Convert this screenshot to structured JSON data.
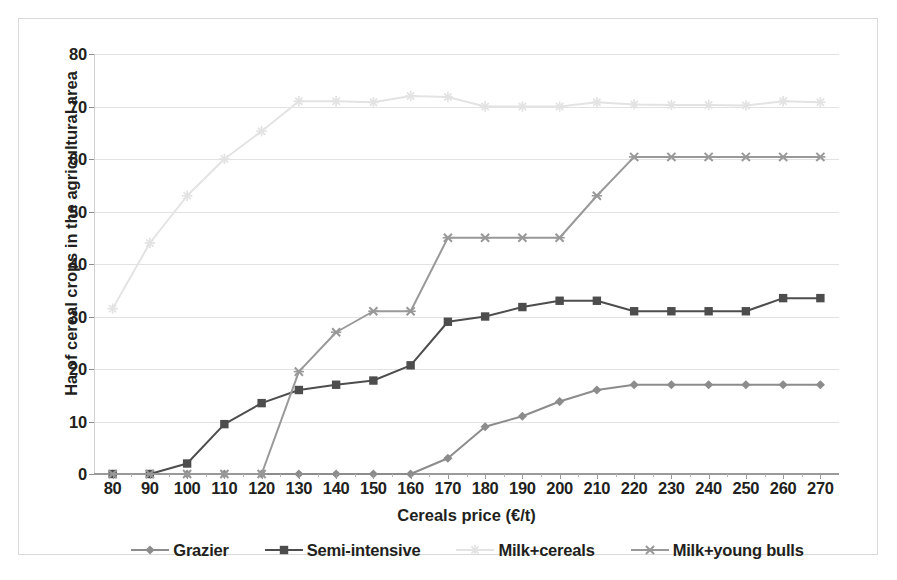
{
  "chart_data": {
    "type": "line",
    "title": "",
    "xlabel": "Cereals price (€/t)",
    "ylabel": "Ha of cereal crops in the agricultural area",
    "xlim": [
      75,
      275
    ],
    "ylim": [
      0,
      80
    ],
    "grid": true,
    "legend_position": "bottom",
    "x": [
      80,
      90,
      100,
      110,
      120,
      130,
      140,
      150,
      160,
      170,
      180,
      190,
      200,
      210,
      220,
      230,
      240,
      250,
      260,
      270
    ],
    "xticklabels": [
      "80",
      "90",
      "100",
      "110",
      "120",
      "130",
      "140",
      "150",
      "160",
      "170",
      "180",
      "190",
      "200",
      "210",
      "220",
      "230",
      "240",
      "250",
      "260",
      "270"
    ],
    "yticklabels": [
      "0",
      "10",
      "20",
      "30",
      "40",
      "50",
      "60",
      "70",
      "80"
    ],
    "yticks": [
      0,
      10,
      20,
      30,
      40,
      50,
      60,
      70,
      80
    ],
    "series": [
      {
        "name": "Grazier",
        "color": "#8c8c8c",
        "marker": "diamond",
        "values": [
          0,
          0,
          0,
          0,
          0,
          0,
          0,
          0,
          0,
          3,
          9,
          11,
          13.8,
          16,
          17,
          17,
          17,
          17,
          17,
          17
        ]
      },
      {
        "name": "Semi-intensive",
        "color": "#4d4d4d",
        "marker": "square",
        "values": [
          0,
          0,
          2,
          9.5,
          13.5,
          16,
          17,
          17.8,
          20.7,
          29,
          30,
          31.8,
          33,
          33,
          31,
          31,
          31,
          31,
          33.5,
          33.5
        ]
      },
      {
        "name": "Milk+cereals",
        "color": "#e3e3e3",
        "marker": "asterisk",
        "values": [
          31.5,
          44,
          53,
          60,
          65.3,
          71,
          71,
          70.8,
          72,
          71.8,
          70,
          70,
          70,
          70.8,
          70.4,
          70.3,
          70.3,
          70.2,
          71,
          70.8
        ]
      },
      {
        "name": "Milk+young bulls",
        "color": "#999999",
        "marker": "x",
        "values": [
          0,
          0,
          0,
          0,
          0,
          19.5,
          27,
          31,
          31,
          45,
          45,
          45,
          45,
          53,
          60.4,
          60.4,
          60.4,
          60.4,
          60.4,
          60.4
        ]
      }
    ]
  },
  "legend": {
    "items": [
      {
        "label": "Grazier"
      },
      {
        "label": "Semi-intensive"
      },
      {
        "label": "Milk+cereals"
      },
      {
        "label": "Milk+young bulls"
      }
    ]
  }
}
